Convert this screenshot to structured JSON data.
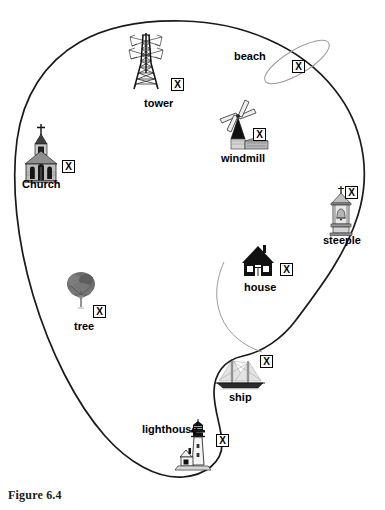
{
  "figure": {
    "caption": "Figure 6.4",
    "colors": {
      "coastline": "#1a1a1a",
      "river": "#8a8a8a",
      "beach_outline": "#9a9a9a",
      "label_text": "#000000",
      "background": "#ffffff"
    }
  },
  "features": [
    {
      "id": "tower",
      "label": "tower",
      "icon": "transmission-tower-icon",
      "label_x": 144,
      "label_y": 97,
      "icon_x": 128,
      "icon_y": 36,
      "marker": {
        "text": "X",
        "x": 171,
        "y": 78
      }
    },
    {
      "id": "beach",
      "label": "beach",
      "icon": "beach-ellipse-icon",
      "label_x": 234,
      "label_y": 50,
      "icon_x": 268,
      "icon_y": 31,
      "marker": {
        "text": "X",
        "x": 292,
        "y": 60
      }
    },
    {
      "id": "windmill",
      "label": "windmill",
      "icon": "windmill-icon",
      "label_x": 221,
      "label_y": 152,
      "icon_x": 222,
      "icon_y": 107,
      "marker": {
        "text": "X",
        "x": 253,
        "y": 128
      }
    },
    {
      "id": "church",
      "label": "Church",
      "icon": "church-icon",
      "label_x": 22,
      "label_y": 178,
      "icon_x": 25,
      "icon_y": 126,
      "marker": {
        "text": "X",
        "x": 62,
        "y": 160
      }
    },
    {
      "id": "steeple",
      "label": "steeple",
      "icon": "steeple-bell-tower-icon",
      "label_x": 323,
      "label_y": 234,
      "icon_x": 329,
      "icon_y": 190,
      "marker": {
        "text": "X",
        "x": 345,
        "y": 186
      }
    },
    {
      "id": "house",
      "label": "house",
      "icon": "house-icon",
      "label_x": 244,
      "label_y": 281,
      "icon_x": 243,
      "icon_y": 246,
      "marker": {
        "text": "X",
        "x": 280,
        "y": 263
      }
    },
    {
      "id": "tree",
      "label": "tree",
      "icon": "tree-icon",
      "label_x": 74,
      "label_y": 320,
      "icon_x": 66,
      "icon_y": 273,
      "marker": {
        "text": "X",
        "x": 93,
        "y": 305
      }
    },
    {
      "id": "ship",
      "label": "ship",
      "icon": "sailing-ship-icon",
      "label_x": 229,
      "label_y": 391,
      "icon_x": 218,
      "icon_y": 358,
      "marker": {
        "text": "X",
        "x": 260,
        "y": 355
      }
    },
    {
      "id": "lighthouse",
      "label": "lighthouse",
      "icon": "lighthouse-icon",
      "label_x": 142,
      "label_y": 423,
      "icon_x": 180,
      "icon_y": 423,
      "marker": {
        "text": "X",
        "x": 216,
        "y": 434
      }
    }
  ]
}
